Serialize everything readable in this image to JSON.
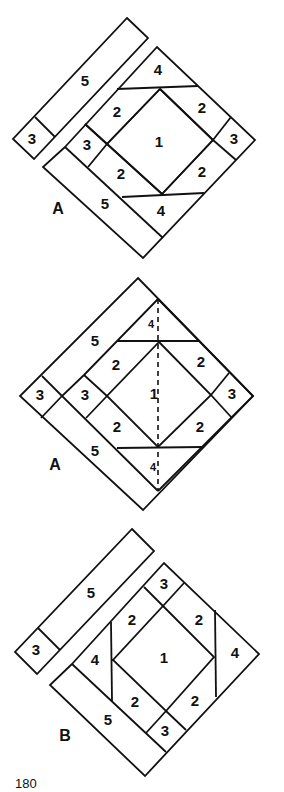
{
  "page_number": "180",
  "figures": [
    {
      "id": "A-exploded",
      "caption": "A",
      "labels": {
        "strip5": "5",
        "strip3": "3",
        "top4": "4",
        "top_left2": "2",
        "top_right2": "2",
        "left3": "3",
        "center1": "1",
        "right3": "3",
        "bottom_left2": "2",
        "bottom_right2": "2",
        "bottom5": "5",
        "bottom4": "4"
      }
    },
    {
      "id": "A-assembled",
      "caption": "A",
      "labels": {
        "top5": "5",
        "outer3": "3",
        "left3": "3",
        "top4": "4",
        "top_left2": "2",
        "top_right2": "2",
        "center1": "1",
        "right3": "3",
        "bottom_left2": "2",
        "bottom_right2": "2",
        "bottom5": "5",
        "bottom4": "4"
      }
    },
    {
      "id": "B-exploded",
      "caption": "B",
      "labels": {
        "strip5": "5",
        "strip3": "3",
        "top3": "3",
        "top_left2": "2",
        "top_right2": "2",
        "left4": "4",
        "center1": "1",
        "right4": "4",
        "bottom_left2": "2",
        "bottom_right2": "2",
        "bottom5": "5",
        "bottom3": "3"
      }
    }
  ]
}
